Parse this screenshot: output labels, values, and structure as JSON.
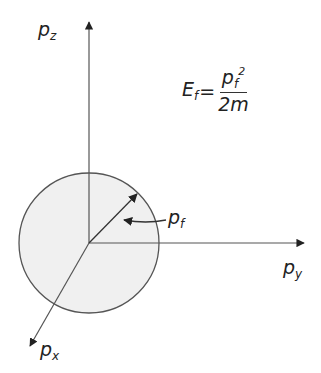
{
  "diagram": {
    "type": "fermi-sphere",
    "origin": [
      89,
      243
    ],
    "sphere": {
      "radius": 70,
      "fill": "#f0f0f0",
      "stroke": "#555555"
    },
    "axes": [
      {
        "id": "pz",
        "label_base": "p",
        "label_sub": "z",
        "tip": [
          89,
          22
        ]
      },
      {
        "id": "py",
        "label_base": "p",
        "label_sub": "y",
        "tip": [
          304,
          243
        ]
      },
      {
        "id": "px",
        "label_base": "p",
        "label_sub": "x",
        "tip": [
          30,
          346
        ]
      }
    ],
    "radius_vector": {
      "label_base": "p",
      "label_sub": "f"
    },
    "formula": {
      "lhs_base": "E",
      "lhs_sub": "f",
      "equals": "=",
      "num_base": "p",
      "num_sub": "f",
      "num_sup": "2",
      "denominator": "2m"
    }
  }
}
